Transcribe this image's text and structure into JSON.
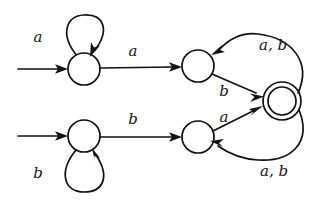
{
  "figure": {
    "kind": "finite-automaton-diagram",
    "width": 318,
    "height": 204,
    "background_color": "#ffffff",
    "ink_color": "#111111"
  },
  "alphabet": [
    "a",
    "b"
  ],
  "states": [
    {
      "id": "q_top_start",
      "label": "",
      "shape": "circle",
      "accepting": false,
      "start": true,
      "cx": 84,
      "cy": 69,
      "r": 16
    },
    {
      "id": "q_top_mid",
      "label": "",
      "shape": "circle",
      "accepting": false,
      "start": false,
      "cx": 198,
      "cy": 66,
      "r": 16
    },
    {
      "id": "q_bot_start",
      "label": "",
      "shape": "circle",
      "accepting": false,
      "start": true,
      "cx": 84,
      "cy": 136,
      "r": 16
    },
    {
      "id": "q_bot_mid",
      "label": "",
      "shape": "circle",
      "accepting": false,
      "start": false,
      "cx": 198,
      "cy": 137,
      "r": 16
    },
    {
      "id": "q_accept",
      "label": "",
      "shape": "double-circle",
      "accepting": true,
      "start": false,
      "cx": 282,
      "cy": 101,
      "r": 19,
      "r_inner": 14
    }
  ],
  "start_arrows": [
    {
      "id": "start-arrow-top",
      "target": "q_top_start",
      "label": "a",
      "label_x": 38,
      "label_y": 42
    },
    {
      "id": "start-arrow-bottom",
      "target": "q_bot_start",
      "label": "b",
      "label_x": 38,
      "label_y": 178
    }
  ],
  "transitions": [
    {
      "id": "t-top-self",
      "from": "q_top_start",
      "to": "q_top_start",
      "label": "",
      "kind": "self-loop-up"
    },
    {
      "id": "t-top-forward",
      "from": "q_top_start",
      "to": "q_top_mid",
      "label": "a",
      "label_x": 133,
      "label_y": 56
    },
    {
      "id": "t-top-mid-to-accept",
      "from": "q_top_mid",
      "to": "q_accept",
      "label": "b",
      "label_x": 224,
      "label_y": 96
    },
    {
      "id": "t-accept-to-top-mid",
      "from": "q_accept",
      "to": "q_top_mid",
      "label": "a, b",
      "label_x": 256,
      "label_y": 49
    },
    {
      "id": "t-bot-self",
      "from": "q_bot_start",
      "to": "q_bot_start",
      "label": "",
      "kind": "self-loop-down"
    },
    {
      "id": "t-bot-forward",
      "from": "q_bot_start",
      "to": "q_bot_mid",
      "label": "b",
      "label_x": 133,
      "label_y": 124
    },
    {
      "id": "t-bot-mid-to-accept",
      "from": "q_bot_mid",
      "to": "q_accept",
      "label": "a",
      "label_x": 224,
      "label_y": 121
    },
    {
      "id": "t-accept-to-bot-mid",
      "from": "q_accept",
      "to": "q_bot_mid",
      "label": "a, b",
      "label_x": 257,
      "label_y": 175
    }
  ],
  "labels": {
    "start_top": "a",
    "start_bottom": "b",
    "top_forward": "a",
    "bottom_forward": "b",
    "top_to_accept": "b",
    "bottom_to_accept": "a",
    "accept_back_top": "a, b",
    "accept_back_bottom": "a, b"
  }
}
